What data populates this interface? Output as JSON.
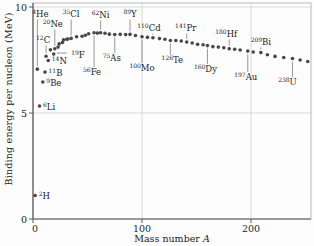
{
  "chart_data": {
    "type": "scatter",
    "title": "",
    "xlabel": "Mass number",
    "xlabel_var": "A",
    "ylabel": "Binding energy per nucleon (MeV)",
    "xlim": [
      0,
      255
    ],
    "ylim": [
      0,
      10.19
    ],
    "x_ticks": [
      0,
      100,
      200
    ],
    "y_ticks": [
      0,
      5,
      10
    ],
    "grid": true,
    "legend": "none",
    "colors": {
      "point": "#474747",
      "grid": "#d9d9d9",
      "box": "#b9b9b9",
      "axis": "#5a5a5a",
      "leader": "#7d7d7d",
      "text": "#1c1c1c"
    },
    "points": [
      [
        2,
        1.11
      ],
      [
        4,
        7.07
      ],
      [
        6,
        5.33
      ],
      [
        9,
        6.46
      ],
      [
        11,
        6.93
      ],
      [
        12,
        7.68
      ],
      [
        14,
        7.48
      ],
      [
        16,
        7.98
      ],
      [
        19,
        7.78
      ],
      [
        20,
        8.03
      ],
      [
        23,
        8.11
      ],
      [
        24,
        8.26
      ],
      [
        27,
        8.33
      ],
      [
        28,
        8.45
      ],
      [
        31,
        8.48
      ],
      [
        32,
        8.49
      ],
      [
        35,
        8.52
      ],
      [
        40,
        8.6
      ],
      [
        45,
        8.62
      ],
      [
        48,
        8.67
      ],
      [
        51,
        8.74
      ],
      [
        56,
        8.79
      ],
      [
        59,
        8.77
      ],
      [
        62,
        8.79
      ],
      [
        66,
        8.76
      ],
      [
        70,
        8.72
      ],
      [
        75,
        8.7
      ],
      [
        80,
        8.71
      ],
      [
        85,
        8.7
      ],
      [
        89,
        8.71
      ],
      [
        94,
        8.66
      ],
      [
        100,
        8.6
      ],
      [
        105,
        8.57
      ],
      [
        110,
        8.55
      ],
      [
        116,
        8.51
      ],
      [
        121,
        8.48
      ],
      [
        126,
        8.42
      ],
      [
        131,
        8.42
      ],
      [
        136,
        8.4
      ],
      [
        141,
        8.35
      ],
      [
        146,
        8.3
      ],
      [
        151,
        8.24
      ],
      [
        156,
        8.22
      ],
      [
        160,
        8.18
      ],
      [
        165,
        8.13
      ],
      [
        170,
        8.11
      ],
      [
        175,
        8.08
      ],
      [
        180,
        8.03
      ],
      [
        185,
        8.01
      ],
      [
        190,
        7.97
      ],
      [
        197,
        7.92
      ],
      [
        202,
        7.88
      ],
      [
        209,
        7.85
      ],
      [
        215,
        7.75
      ],
      [
        222,
        7.67
      ],
      [
        230,
        7.62
      ],
      [
        238,
        7.57
      ],
      [
        245,
        7.5
      ],
      [
        252,
        7.43
      ]
    ],
    "isotope_labels": [
      {
        "sup": "2",
        "sym": "H",
        "a": 2,
        "be": 1.11,
        "pos": "right"
      },
      {
        "sup": "4",
        "sym": "He",
        "a": 4,
        "be": 7.07,
        "pos": "above",
        "ly": 17,
        "dx": 3
      },
      {
        "sup": "6",
        "sym": "Li",
        "a": 6,
        "be": 5.33,
        "pos": "right"
      },
      {
        "sup": "9",
        "sym": "Be",
        "a": 9,
        "be": 6.46,
        "pos": "right"
      },
      {
        "sup": "11",
        "sym": "B",
        "a": 11,
        "be": 6.93,
        "pos": "right"
      },
      {
        "sup": "12",
        "sym": "C",
        "a": 12,
        "be": 7.68,
        "pos": "above",
        "ly": 43,
        "dx": -3
      },
      {
        "sup": "14",
        "sym": "N",
        "a": 14,
        "be": 7.48,
        "pos": "right"
      },
      {
        "sup": "19",
        "sym": "F",
        "a": 19,
        "be": 7.78,
        "pos": "right",
        "dx": 14,
        "leader": true
      },
      {
        "sup": "20",
        "sym": "Ne",
        "a": 20,
        "be": 8.03,
        "pos": "above",
        "ly": 27,
        "dx": -2
      },
      {
        "sup": "35",
        "sym": "Cl",
        "a": 35,
        "be": 8.52,
        "pos": "above",
        "ly": 17
      },
      {
        "sup": "56",
        "sym": "Fe",
        "a": 56,
        "be": 8.79,
        "pos": "below",
        "ly": 75,
        "dx": -2
      },
      {
        "sup": "62",
        "sym": "Ni",
        "a": 62,
        "be": 8.79,
        "pos": "above",
        "ly": 18
      },
      {
        "sup": "75",
        "sym": "As",
        "a": 75,
        "be": 8.7,
        "pos": "below",
        "ly": 61,
        "dx": -3
      },
      {
        "sup": "89",
        "sym": "Y",
        "a": 89,
        "be": 8.71,
        "pos": "above",
        "ly": 17
      },
      {
        "sup": "100",
        "sym": "Mo",
        "a": 100,
        "be": 8.6,
        "pos": "below",
        "ly": 71
      },
      {
        "sup": "110",
        "sym": "Cd",
        "a": 110,
        "be": 8.55,
        "pos": "above",
        "ly": 31,
        "dx": -4
      },
      {
        "sup": "126",
        "sym": "Te",
        "a": 126,
        "be": 8.42,
        "pos": "below",
        "ly": 63,
        "dx": 2
      },
      {
        "sup": "141",
        "sym": "Pr",
        "a": 141,
        "be": 8.35,
        "pos": "above",
        "ly": 31,
        "dx": -1
      },
      {
        "sup": "160",
        "sym": "Dy",
        "a": 160,
        "be": 8.18,
        "pos": "below",
        "ly": 72,
        "dx": -2
      },
      {
        "sup": "180",
        "sym": "Hf",
        "a": 180,
        "be": 8.03,
        "pos": "above",
        "ly": 37,
        "dx": -3
      },
      {
        "sup": "197",
        "sym": "Au",
        "a": 197,
        "be": 7.92,
        "pos": "below",
        "ly": 80,
        "dx": -2
      },
      {
        "sup": "209",
        "sym": "Bi",
        "a": 209,
        "be": 7.85,
        "pos": "above",
        "ly": 45
      },
      {
        "sup": "238",
        "sym": "U",
        "a": 238,
        "be": 7.57,
        "pos": "below",
        "ly": 85,
        "dx": -5
      }
    ]
  }
}
